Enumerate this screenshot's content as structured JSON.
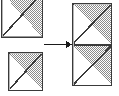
{
  "diagram": {
    "canvas": {
      "width": 119,
      "height": 96
    },
    "colors": {
      "background": "#ffffff",
      "stroke": "#3a3a3a",
      "pattern_dot": "#808080",
      "pattern_background": "#ffffff",
      "empty_fill": "#ffffff",
      "arrow": "#1a1a1a",
      "edge_highlight": "#b0b0b0"
    },
    "pattern": {
      "name": "checkerboard-dither",
      "cell_size": 2,
      "dot_size": 1
    },
    "operands": [
      {
        "name": "operand-tile-top",
        "label": "",
        "x": 1,
        "y": -8,
        "width": 42,
        "height": 46,
        "clipped_top": true,
        "diagonal": "bottom-left-to-top-right",
        "filled_half": "upper-right"
      },
      {
        "name": "operand-tile-bottom",
        "label": "",
        "x": 8,
        "y": 52,
        "width": 35,
        "height": 39,
        "clipped_top": false,
        "diagonal": "bottom-left-to-top-right",
        "filled_half": "upper-right"
      }
    ],
    "arrow": {
      "name": "right-arrow",
      "label": "",
      "x1": 44,
      "y1": 44,
      "x2": 70,
      "y2": 44,
      "head_width": 7,
      "head_height": 7,
      "line_width": 2
    },
    "result": {
      "name": "result-rectangle",
      "label": "",
      "x": 72,
      "y": 3,
      "width": 40,
      "height": 83,
      "divider_y": 45,
      "cells": [
        {
          "name": "result-cell-top",
          "diagonal": "bottom-left-to-top-right",
          "filled_half": "upper-right"
        },
        {
          "name": "result-cell-bottom",
          "diagonal": "bottom-left-to-top-right",
          "filled_half": "upper-right"
        }
      ]
    }
  }
}
